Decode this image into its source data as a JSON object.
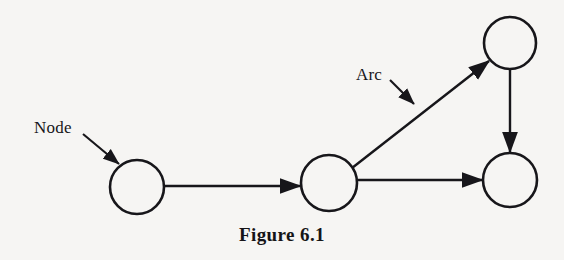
{
  "figure": {
    "caption": "Figure 6.1",
    "background_color": "#f6f5f3",
    "ink_color": "#17161a"
  },
  "labels": {
    "node": "Node",
    "arc": "Arc"
  },
  "diagram": {
    "type": "directed-graph",
    "nodes": [
      {
        "id": "n1",
        "cx": 137,
        "cy": 187,
        "r": 27
      },
      {
        "id": "n2",
        "cx": 329,
        "cy": 183,
        "r": 28
      },
      {
        "id": "n3",
        "cx": 510,
        "cy": 43,
        "r": 26
      },
      {
        "id": "n4",
        "cx": 510,
        "cy": 180,
        "r": 27
      }
    ],
    "arcs": [
      {
        "from": "n1",
        "to": "n2",
        "x1": 164,
        "y1": 186,
        "x2": 300,
        "y2": 186
      },
      {
        "from": "n2",
        "to": "n3",
        "x1": 352,
        "y1": 168,
        "x2": 489,
        "y2": 61
      },
      {
        "from": "n3",
        "to": "n4",
        "x1": 510,
        "y1": 69,
        "x2": 510,
        "y2": 152
      },
      {
        "from": "n2",
        "to": "n4",
        "x1": 357,
        "y1": 180,
        "x2": 482,
        "y2": 180
      }
    ],
    "callouts": [
      {
        "label": "Node",
        "x1": 83,
        "y1": 134,
        "x2": 119,
        "y2": 164
      },
      {
        "label": "Arc",
        "x1": 390,
        "y1": 80,
        "x2": 414,
        "y2": 104
      }
    ]
  }
}
